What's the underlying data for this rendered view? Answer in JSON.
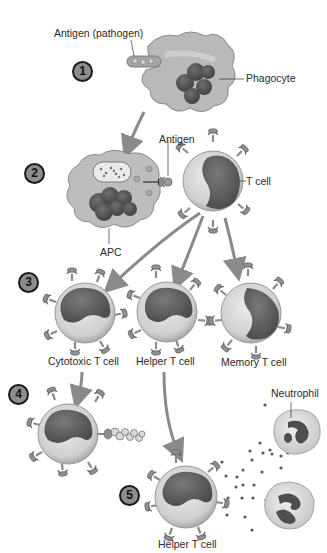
{
  "diagram": {
    "type": "immune-response-flow",
    "steps": [
      {
        "number": "1",
        "x": 72,
        "y": 60
      },
      {
        "number": "2",
        "x": 22,
        "y": 165
      },
      {
        "number": "3",
        "x": 18,
        "y": 276
      },
      {
        "number": "4",
        "x": 8,
        "y": 388
      },
      {
        "number": "5",
        "x": 118,
        "y": 488
      }
    ],
    "labels": {
      "antigen_pathogen": "Antigen (pathogen)",
      "phagocyte": "Phagocyte",
      "antigen": "Antigen",
      "t_cell": "T cell",
      "apc": "APC",
      "cytotoxic_t_cell": "Cytotoxic T cell",
      "helper_t_cell": "Helper T cell",
      "memory_t_cell": "Memory T cell",
      "neutrophil": "Neutrophil",
      "helper_t_cell_5": "Helper T cell"
    },
    "colors": {
      "background": "#ffffff",
      "cell_fill": "#c9c9c9",
      "cell_light": "#e2e2e2",
      "nucleus": "#5e5e5e",
      "arrow": "#8a8a8a",
      "text": "#2a2a2a"
    }
  }
}
